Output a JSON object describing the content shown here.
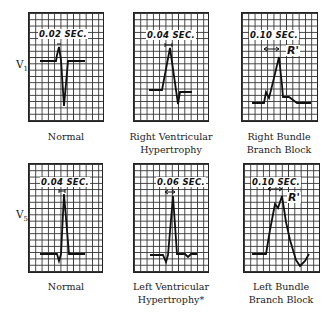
{
  "leads": {
    "v1": {
      "label": "V",
      "sub": "1"
    },
    "v5": {
      "label": "V",
      "sub": "5"
    }
  },
  "panels": [
    {
      "id": "v1-normal",
      "lead": "V1",
      "interval": "0.02 SEC.",
      "caption_line1": "Normal",
      "caption_line2": ""
    },
    {
      "id": "v1-rvh",
      "lead": "V1",
      "interval": "0.04 SEC.",
      "caption_line1": "Right Ventricular",
      "caption_line2": "Hypertrophy"
    },
    {
      "id": "v1-rbbb",
      "lead": "V1",
      "interval": "0.10 SEC.",
      "annotation": "R'",
      "caption_line1": "Right Bundle",
      "caption_line2": "Branch Block"
    },
    {
      "id": "v5-normal",
      "lead": "V5",
      "interval": "0.04 SEC.",
      "caption_line1": "Normal",
      "caption_line2": ""
    },
    {
      "id": "v5-lvh",
      "lead": "V5",
      "interval": "0.06 SEC.",
      "caption_line1": "Left Ventricular",
      "caption_line2": "Hypertrophy*"
    },
    {
      "id": "v5-lbbb",
      "lead": "V5",
      "interval": "0.10 SEC.",
      "annotation": "R'",
      "caption_line1": "Left Bundle",
      "caption_line2": "Branch Block"
    }
  ]
}
